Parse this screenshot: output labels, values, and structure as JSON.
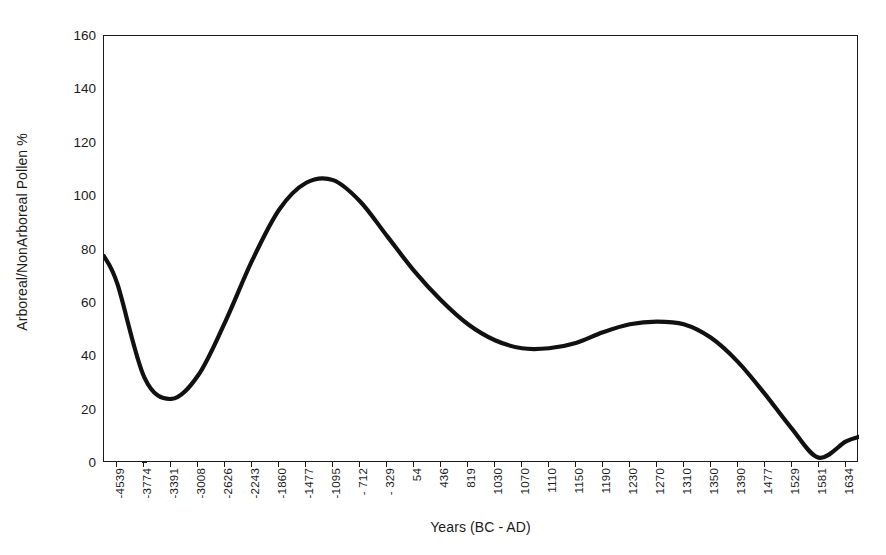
{
  "chart_data": {
    "type": "line",
    "title": "",
    "xlabel": "Years (BC - AD)",
    "ylabel": "Arboreal/NonArboreal Pollen %",
    "ylim": [
      0,
      160
    ],
    "yticks": [
      0,
      20,
      40,
      60,
      80,
      100,
      120,
      140,
      160
    ],
    "grid": false,
    "legend": "none",
    "line_color": "#111111",
    "categories": [
      "-4539",
      "-3774",
      "-3391",
      "-3008",
      "-2626",
      "-2243",
      "-1860",
      "-1477",
      "-1095",
      "- 712",
      "- 329",
      "54",
      "436",
      "819",
      "1030",
      "1070",
      "1110",
      "1150",
      "1190",
      "1230",
      "1270",
      "1310",
      "1350",
      "1390",
      "1477",
      "1529",
      "1581",
      "1634"
    ],
    "values": [
      67,
      32,
      24,
      33,
      53,
      76,
      95,
      105,
      106,
      98,
      85,
      72,
      61,
      52,
      46,
      43,
      43,
      45,
      49,
      52,
      53,
      52,
      47,
      38,
      26,
      13,
      2,
      8
    ]
  }
}
